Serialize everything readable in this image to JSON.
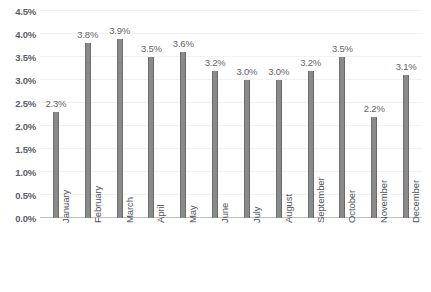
{
  "chart_data": {
    "type": "bar",
    "title": "",
    "subtitle": "",
    "xlabel": "",
    "ylabel": "",
    "categories": [
      "January",
      "February",
      "March",
      "April",
      "May",
      "June",
      "July",
      "August",
      "September",
      "October",
      "November",
      "December"
    ],
    "values": [
      2.3,
      3.8,
      3.9,
      3.5,
      3.6,
      3.2,
      3.0,
      3.0,
      3.2,
      3.5,
      2.2,
      3.1
    ],
    "data_labels": [
      "2.3%",
      "3.8%",
      "3.9%",
      "3.5%",
      "3.6%",
      "3.2%",
      "3.0%",
      "3.0%",
      "3.2%",
      "3.5%",
      "2.2%",
      "3.1%"
    ],
    "ylim": [
      0,
      4.5
    ],
    "ytick_values": [
      0.0,
      0.5,
      1.0,
      1.5,
      2.0,
      2.5,
      3.0,
      3.5,
      4.0,
      4.5
    ],
    "ytick_labels": [
      "0.0%",
      "0.5%",
      "1.0%",
      "1.5%",
      "2.0%",
      "2.5%",
      "3.0%",
      "3.5%",
      "4.0%",
      "4.5%"
    ],
    "grid": true,
    "legend": false,
    "legend_position": "none",
    "xtick_rotation": -90,
    "series": [
      {
        "name": "",
        "values": [
          2.3,
          3.8,
          3.9,
          3.5,
          3.6,
          3.2,
          3.0,
          3.0,
          3.2,
          3.5,
          2.2,
          3.1
        ]
      }
    ]
  },
  "colors": {
    "bar": "#8a8a8a",
    "bar_edge": "#6f6f6f",
    "gridline": "#f2f2f2",
    "axis_line": "#bfbfbf",
    "ytick_text": "#585e69",
    "xtick_text": "#4e535d",
    "data_label_text": "#5f646e",
    "background": "#ffffff"
  }
}
